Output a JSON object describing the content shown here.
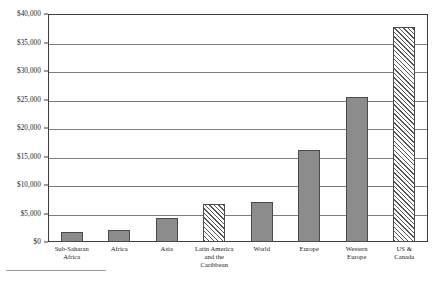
{
  "chart_data": {
    "type": "bar",
    "title": "",
    "xlabel": "",
    "ylabel": "",
    "ylim": [
      0,
      40000
    ],
    "grid": true,
    "legend": "none",
    "categories": [
      "Sub-Saharan Africa",
      "Africa",
      "Asia",
      "Latin America and the Caribbean",
      "World",
      "Europe",
      "Western Europe",
      "US & Canada"
    ],
    "values": [
      1800,
      2100,
      4300,
      6700,
      7000,
      16200,
      25500,
      37800
    ],
    "bar_styles": [
      "solid",
      "solid",
      "solid",
      "hatched",
      "solid",
      "solid",
      "solid",
      "hatched"
    ],
    "y_ticks": [
      {
        "value": 0,
        "label": "$0"
      },
      {
        "value": 5000,
        "label": "$5,000"
      },
      {
        "value": 10000,
        "label": "$10,000"
      },
      {
        "value": 15000,
        "label": "$15,000"
      },
      {
        "value": 20000,
        "label": "$20,000"
      },
      {
        "value": 25000,
        "label": "$25,000"
      },
      {
        "value": 30000,
        "label": "$30,000"
      },
      {
        "value": 35000,
        "label": "$35,000"
      },
      {
        "value": 40000,
        "label": "$40,000"
      }
    ],
    "x_tick_labels": [
      [
        "Sub-Saharan",
        "Africa"
      ],
      [
        "Africa"
      ],
      [
        "Asia"
      ],
      [
        "Latin America",
        "and the",
        "Caribbean"
      ],
      [
        "World"
      ],
      [
        "Europe"
      ],
      [
        "Western",
        "Europe"
      ],
      [
        "US &",
        "Canada"
      ]
    ],
    "colors": {
      "bar_fill": "#8c8c8c",
      "bar_border": "#4a4a4a",
      "hatch_stroke": "#555555",
      "gridline": "#7d7d7d",
      "frame": "#3d3d3d",
      "text": "#1a1a1a",
      "background": "#ffffff"
    }
  }
}
